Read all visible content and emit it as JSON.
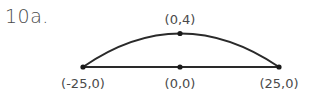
{
  "problem": {
    "label": "10a."
  },
  "diagram": {
    "points": [
      {
        "name": "left-endpoint",
        "label": "(-25,0)",
        "x": 83,
        "y": 67
      },
      {
        "name": "center-point",
        "label": "(0,0)",
        "x": 180,
        "y": 67
      },
      {
        "name": "right-endpoint",
        "label": "(25,0)",
        "x": 279,
        "y": 67
      },
      {
        "name": "apex-point",
        "label": "(0,4)",
        "x": 180,
        "y": 33
      }
    ],
    "line_color": "#2a2a2a",
    "text_color": "#4a4a4a"
  }
}
